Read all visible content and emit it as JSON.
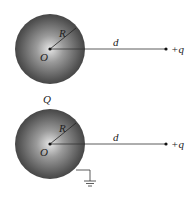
{
  "diagram": {
    "figures": [
      {
        "id": "isolated-sphere",
        "center_label": "O",
        "radius_label": "R",
        "distance_label": "d",
        "point_charge_label": "+q",
        "grounded": false
      },
      {
        "id": "grounded-sphere",
        "sphere_charge_label": "Q",
        "center_label": "O",
        "radius_label": "R",
        "distance_label": "d",
        "point_charge_label": "+q",
        "grounded": true
      }
    ],
    "colors": {
      "sphere_dark": "#3a3a3a",
      "sphere_light": "#d8d8d8",
      "line": "#333333",
      "background": "#ffffff"
    }
  }
}
